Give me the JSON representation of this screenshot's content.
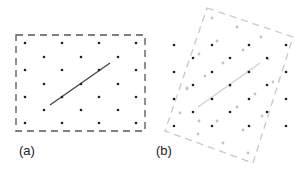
{
  "panels": [
    {
      "label": "(a)",
      "label_pos": [
        19,
        143
      ],
      "box": {
        "points": [
          [
            16,
            35
          ],
          [
            145,
            35
          ],
          [
            145,
            131
          ],
          [
            16,
            131
          ]
        ],
        "color": "#555555",
        "dash": "7,5"
      },
      "line": {
        "from": [
          50,
          105
        ],
        "to": [
          110,
          63
        ],
        "color": "#444444",
        "width": 1.3
      },
      "dots": {
        "color": "#222222",
        "points": [
          [
            25,
            43
          ],
          [
            62,
            43
          ],
          [
            99,
            43
          ],
          [
            136,
            43
          ],
          [
            44,
            57
          ],
          [
            81,
            57
          ],
          [
            118,
            57
          ],
          [
            25,
            70
          ],
          [
            62,
            70
          ],
          [
            99,
            70
          ],
          [
            136,
            70
          ],
          [
            44,
            84
          ],
          [
            81,
            84
          ],
          [
            118,
            84
          ],
          [
            25,
            97
          ],
          [
            62,
            97
          ],
          [
            99,
            97
          ],
          [
            136,
            97
          ],
          [
            44,
            110
          ],
          [
            81,
            110
          ],
          [
            118,
            110
          ],
          [
            25,
            123
          ],
          [
            62,
            123
          ],
          [
            99,
            123
          ],
          [
            136,
            123
          ]
        ]
      }
    },
    {
      "label": "(b)",
      "label_pos": [
        156,
        143
      ],
      "box": {
        "points": [
          [
            207,
            8
          ],
          [
            293,
            37
          ],
          [
            253,
            163
          ],
          [
            165,
            131
          ]
        ],
        "color": "#c8c8c8",
        "dash": "7,5"
      },
      "line": {
        "from": [
          198,
          107
        ],
        "to": [
          260,
          63
        ],
        "color": "#d0d0d0",
        "width": 1.2
      },
      "dots": {
        "color": "#222222",
        "points": [
          [
            174,
            45
          ],
          [
            212,
            45
          ],
          [
            249,
            45
          ],
          [
            286,
            45
          ],
          [
            193,
            58
          ],
          [
            230,
            58
          ],
          [
            267,
            58
          ],
          [
            174,
            72
          ],
          [
            212,
            72
          ],
          [
            249,
            72
          ],
          [
            286,
            72
          ],
          [
            193,
            85
          ],
          [
            230,
            85
          ],
          [
            267,
            85
          ],
          [
            174,
            99
          ],
          [
            212,
            99
          ],
          [
            249,
            99
          ],
          [
            286,
            99
          ],
          [
            193,
            112
          ],
          [
            230,
            112
          ],
          [
            267,
            112
          ],
          [
            174,
            126
          ],
          [
            212,
            126
          ],
          [
            249,
            126
          ],
          [
            286,
            126
          ]
        ]
      },
      "grey_dots": {
        "color": "#c4c4c4",
        "points": [
          [
            212,
            18
          ],
          [
            237,
            27
          ],
          [
            261,
            37
          ],
          [
            217,
            41
          ],
          [
            243,
            50
          ],
          [
            268,
            59
          ],
          [
            199,
            54
          ],
          [
            223,
            63
          ],
          [
            248,
            72
          ],
          [
            273,
            82
          ],
          [
            187,
            88
          ],
          [
            205,
            76
          ],
          [
            230,
            86
          ],
          [
            255,
            94
          ],
          [
            187,
            89
          ],
          [
            212,
            99
          ],
          [
            237,
            107
          ],
          [
            262,
            116
          ],
          [
            180,
            113
          ],
          [
            199,
            121
          ],
          [
            217,
            121
          ],
          [
            243,
            130
          ],
          [
            198,
            134
          ],
          [
            223,
            143
          ],
          [
            248,
            153
          ]
        ]
      }
    }
  ]
}
